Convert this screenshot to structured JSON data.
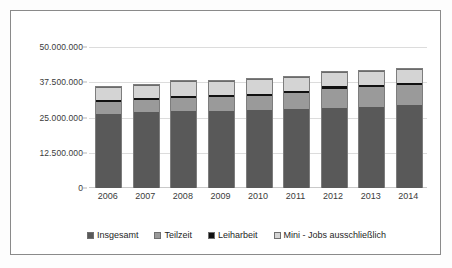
{
  "chart_data": {
    "type": "bar",
    "subtype": "stacked-column",
    "title": "",
    "xlabel": "",
    "ylabel": "",
    "categories": [
      "2006",
      "2007",
      "2008",
      "2009",
      "2010",
      "2011",
      "2012",
      "2013",
      "2014"
    ],
    "ylim": [
      0,
      50000000
    ],
    "yticks": [
      0,
      12500000,
      25000000,
      37500000,
      50000000
    ],
    "ytick_labels": [
      "0",
      "12.500.000",
      "25.000.000",
      "37.500.000",
      "50.000.000"
    ],
    "grid": true,
    "legend_position": "bottom",
    "series": [
      {
        "name": "Insgesamt",
        "color": "#595959",
        "values": [
          26200000,
          26900000,
          27300000,
          27300000,
          27600000,
          28000000,
          28500000,
          28800000,
          29300000
        ]
      },
      {
        "name": "Teilzeit",
        "color": "#9a9a9a",
        "values": [
          4400000,
          4300000,
          4700000,
          4800000,
          5100000,
          5600000,
          6700000,
          6900000,
          7100000
        ]
      },
      {
        "name": "Leiharbeit",
        "color": "#111111",
        "values": [
          700000,
          750000,
          800000,
          750000,
          820000,
          870000,
          880000,
          870000,
          900000
        ]
      },
      {
        "name": "Mini - Jobs ausschließlich",
        "color": "#d4d4d4",
        "values": [
          4500000,
          4550000,
          5000000,
          4950000,
          5000000,
          5000000,
          5000000,
          4950000,
          5000000
        ]
      }
    ]
  },
  "legend": {
    "items": [
      {
        "label": "Insgesamt",
        "color": "#595959"
      },
      {
        "label": "Teilzeit",
        "color": "#9a9a9a"
      },
      {
        "label": "Leiharbeit",
        "color": "#111111"
      },
      {
        "label": "Mini - Jobs ausschließlich",
        "color": "#d4d4d4"
      }
    ]
  }
}
